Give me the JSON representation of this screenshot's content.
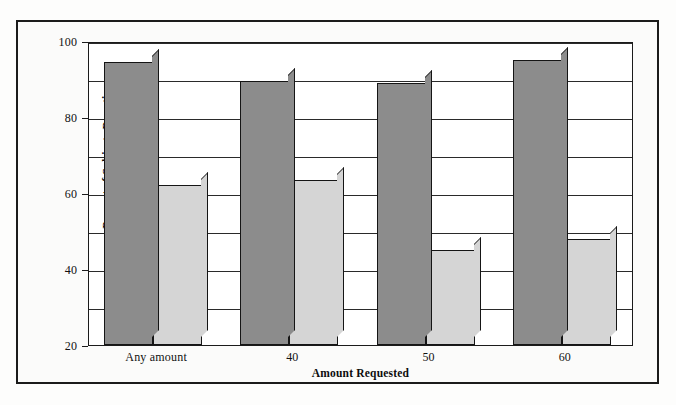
{
  "chart_data": {
    "type": "bar",
    "title": "",
    "xlabel": "Amount Requested",
    "ylabel": "Percent of Subjects Donating\nMoney in Israeli Pounds",
    "categories": [
      "Any amount",
      "40",
      "50",
      "60"
    ],
    "series": [
      {
        "name": "Subjects asked to sign petition\ntwo weeks prior to collection",
        "color": "#8c8c8c",
        "values": [
          94.5,
          89.5,
          89,
          95
        ]
      },
      {
        "name": "Subjects asked only for\nmoney on day of collection",
        "color": "#d5d5d5",
        "values": [
          62,
          63.5,
          45,
          48
        ]
      }
    ],
    "ylim": [
      20,
      100
    ],
    "ytick_labels": [
      "20",
      "40",
      "60",
      "80",
      "100"
    ],
    "ytick_values": [
      20,
      40,
      60,
      80,
      100
    ],
    "gridline_values": [
      30,
      40,
      50,
      60,
      70,
      80,
      90,
      100
    ],
    "grid": true,
    "legend_position": "top-center"
  },
  "legend": {
    "entries": [
      {
        "label": "Subjects asked to sign petition\ntwo weeks prior to collection",
        "color": "#8c8c8c"
      },
      {
        "label": "Subjects asked only for\nmoney on day of collection",
        "color": "#d5d5d5"
      }
    ]
  },
  "colors": {
    "series_dark": "#8c8c8c",
    "series_light": "#d5d5d5",
    "frame": "#1b1b1b",
    "grid": "#2a2a2a",
    "text": "#111111",
    "background": "#fbfbfa"
  }
}
